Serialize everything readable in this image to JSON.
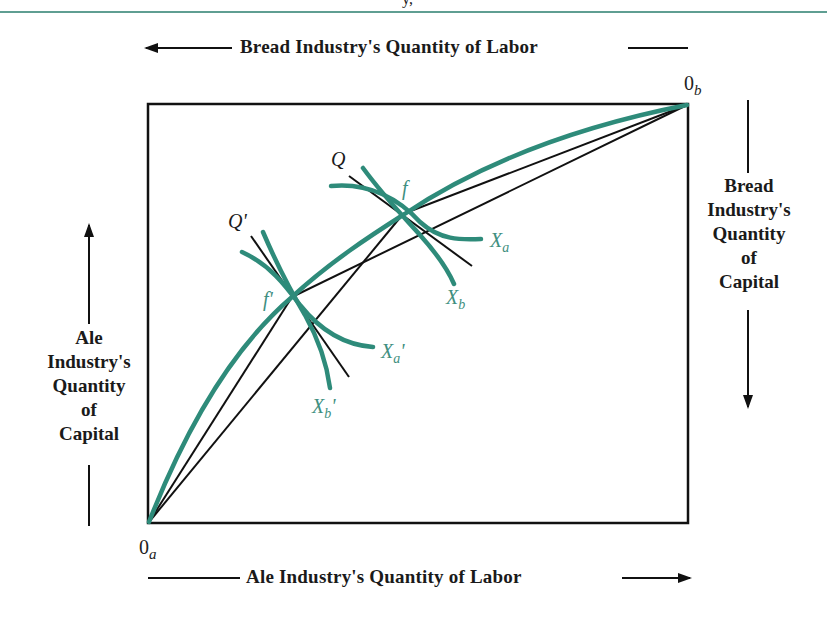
{
  "header": {
    "partial_glyph": "y,"
  },
  "axes": {
    "top_label": "Bread Industry's Quantity of Labor",
    "bottom_label": "Ale Industry's Quantity of Labor",
    "left_label_lines": [
      "Ale",
      "Industry's",
      "Quantity",
      "of",
      "Capital"
    ],
    "right_label_lines": [
      "Bread",
      "Industry's",
      "Quantity",
      "of",
      "Capital"
    ]
  },
  "origins": {
    "ale": {
      "base": "0",
      "sub": "a"
    },
    "bread": {
      "base": "0",
      "sub": "b"
    }
  },
  "points": {
    "f": "f",
    "f_prime": "f'",
    "Q": "Q",
    "Q_prime": "Q'"
  },
  "isoquants": {
    "Xa": {
      "base": "X",
      "sub": "a",
      "prime": ""
    },
    "Xb": {
      "base": "X",
      "sub": "b",
      "prime": ""
    },
    "Xa_prime": {
      "base": "X",
      "sub": "a",
      "prime": "'"
    },
    "Xb_prime": {
      "base": "X",
      "sub": "b",
      "prime": "'"
    }
  },
  "colors": {
    "curve": "#2e8b7a",
    "line": "#111111",
    "rule": "#5f9e92"
  }
}
